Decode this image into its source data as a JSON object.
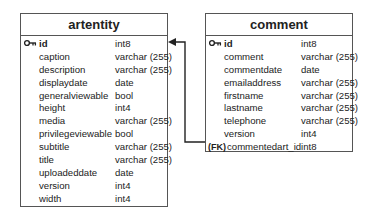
{
  "diagram": {
    "type": "entity-relationship",
    "entities": [
      {
        "name": "artentity",
        "fields": [
          {
            "name": "id",
            "type": "int8",
            "key": "PK"
          },
          {
            "name": "caption",
            "type": "varchar (255)"
          },
          {
            "name": "description",
            "type": "varchar (255)"
          },
          {
            "name": "displaydate",
            "type": "date"
          },
          {
            "name": "generalviewable",
            "type": "bool"
          },
          {
            "name": "height",
            "type": "int4"
          },
          {
            "name": "media",
            "type": "varchar (255)"
          },
          {
            "name": "privilegeviewable",
            "type": "bool"
          },
          {
            "name": "subtitle",
            "type": "varchar (255)"
          },
          {
            "name": "title",
            "type": "varchar (255)"
          },
          {
            "name": "uploadeddate",
            "type": "date"
          },
          {
            "name": "version",
            "type": "int4"
          },
          {
            "name": "width",
            "type": "int4"
          }
        ]
      },
      {
        "name": "comment",
        "fields": [
          {
            "name": "id",
            "type": "int8",
            "key": "PK"
          },
          {
            "name": "comment",
            "type": "varchar (255)"
          },
          {
            "name": "commentdate",
            "type": "date"
          },
          {
            "name": "emailaddress",
            "type": "varchar (255)"
          },
          {
            "name": "firstname",
            "type": "varchar (255)"
          },
          {
            "name": "lastname",
            "type": "varchar (255)"
          },
          {
            "name": "telephone",
            "type": "varchar (255)"
          },
          {
            "name": "version",
            "type": "int4"
          },
          {
            "name": "commentedart_id",
            "type": "int8",
            "key": "FK",
            "key_label": "(FK)"
          }
        ]
      }
    ],
    "relationships": [
      {
        "from": "comment.commentedart_id",
        "to": "artentity.id",
        "arrow": "to"
      }
    ],
    "icons": {
      "primary_key": "key-icon"
    },
    "colors": {
      "border": "#555555",
      "text": "#222222",
      "line": "#222222"
    }
  }
}
